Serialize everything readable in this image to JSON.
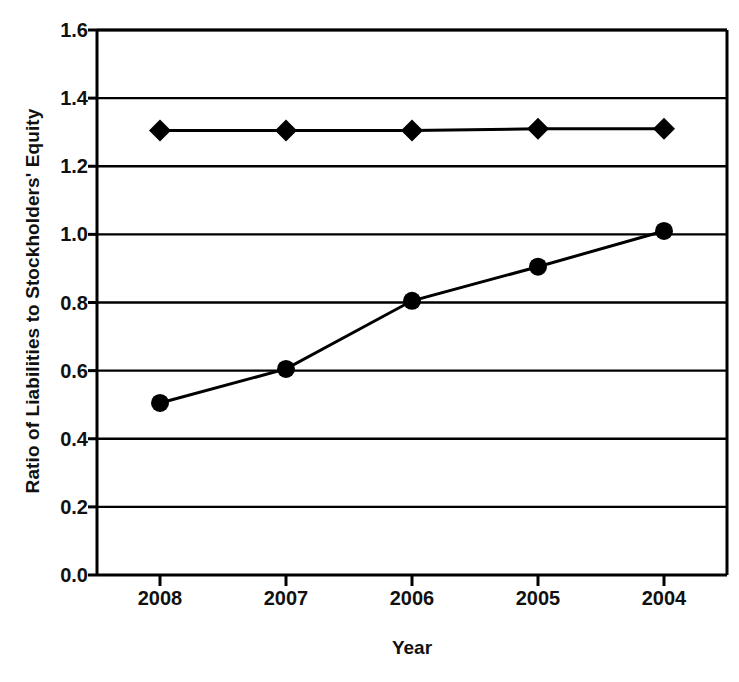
{
  "chart_data": {
    "type": "line",
    "title": "",
    "xlabel": "Year",
    "ylabel": "Ratio of Liabilities to Stockholders' Equity",
    "categories": [
      "2008",
      "2007",
      "2006",
      "2005",
      "2004"
    ],
    "series": [
      {
        "name": "series-diamond",
        "marker": "diamond",
        "color": "#000000",
        "values": [
          1.305,
          1.305,
          1.305,
          1.31,
          1.31
        ]
      },
      {
        "name": "series-circle",
        "marker": "circle",
        "color": "#000000",
        "values": [
          0.505,
          0.605,
          0.805,
          0.905,
          1.01
        ]
      }
    ],
    "ylim": [
      0.0,
      1.6
    ],
    "ytick_values": [
      0.0,
      0.2,
      0.4,
      0.6,
      0.8,
      1.0,
      1.2,
      1.4,
      1.6
    ],
    "ytick_labels": [
      "0.0",
      "0.2",
      "0.4",
      "0.6",
      "0.8",
      "1.0",
      "1.2",
      "1.4",
      "1.6"
    ],
    "grid": true,
    "grid_axis": "y",
    "legend": false,
    "legend_position": "none",
    "background_color": "#ffffff",
    "axis_color": "#000000"
  }
}
